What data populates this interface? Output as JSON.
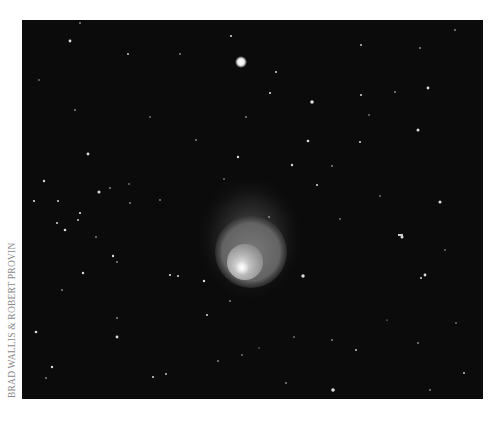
{
  "photo": {
    "subject": "comet with glowing coma in star field",
    "background_color": "#0b0b0b",
    "comet": {
      "halo": {
        "cx": 250,
        "cy": 235,
        "rx": 52,
        "ry": 62,
        "opacity": 0.22
      },
      "outer_coma": {
        "cx": 251,
        "cy": 252,
        "r": 36,
        "color": "#6e6e6e"
      },
      "inner_coma": {
        "cx": 245,
        "cy": 262,
        "r": 17,
        "color": "#b0b0b0"
      },
      "nucleus": {
        "cx": 242,
        "cy": 268,
        "r": 5,
        "color": "#ffffff"
      }
    },
    "bright_star": {
      "cx": 241,
      "cy": 62,
      "r": 4
    }
  },
  "credit": {
    "text": "Brad Wallis & Robert Provin"
  }
}
